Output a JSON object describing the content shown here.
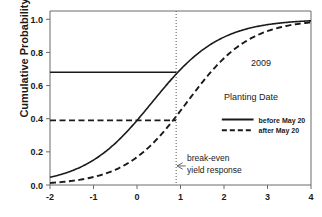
{
  "chart_data": {
    "type": "line",
    "title": "",
    "xlabel": "",
    "ylabel": "Cumulative Probability",
    "xlim": [
      -2,
      4
    ],
    "ylim": [
      0,
      1.05
    ],
    "xticks": [
      "-2",
      "-1",
      "0",
      "1",
      "2",
      "3",
      "4"
    ],
    "xtick_values": [
      -2,
      -1,
      0,
      1,
      2,
      3,
      4
    ],
    "yticks": [
      "0.0",
      "0.2",
      "0.4",
      "0.6",
      "0.8",
      "1.0"
    ],
    "ytick_values": [
      0.0,
      0.2,
      0.4,
      0.6,
      0.8,
      1.0
    ],
    "grid": false,
    "legend_position": "right",
    "series": [
      {
        "name": "before May 20",
        "style": "solid",
        "color": "#1a1a1a",
        "model": "logistic",
        "midpoint": 0.35,
        "scale": 0.78,
        "x": [
          -2.0,
          -1.75,
          -1.5,
          -1.25,
          -1.0,
          -0.75,
          -0.5,
          -0.25,
          0.0,
          0.25,
          0.5,
          0.75,
          0.9,
          1.0,
          1.25,
          1.5,
          1.75,
          2.0,
          2.25,
          2.5,
          2.75,
          3.0,
          3.25,
          3.5,
          3.75,
          4.0
        ],
        "y": [
          0.048,
          0.064,
          0.085,
          0.112,
          0.147,
          0.19,
          0.243,
          0.305,
          0.376,
          0.452,
          0.53,
          0.605,
          0.647,
          0.674,
          0.736,
          0.79,
          0.835,
          0.872,
          0.901,
          0.925,
          0.943,
          0.957,
          0.968,
          0.976,
          0.982,
          0.987
        ]
      },
      {
        "name": "after May 20",
        "style": "dashed",
        "color": "#1a1a1a",
        "model": "logistic",
        "midpoint": 1.15,
        "scale": 0.72,
        "x": [
          -2.0,
          -1.75,
          -1.5,
          -1.25,
          -1.0,
          -0.75,
          -0.5,
          -0.25,
          0.0,
          0.25,
          0.5,
          0.75,
          0.9,
          1.0,
          1.25,
          1.5,
          1.75,
          2.0,
          2.25,
          2.5,
          2.75,
          3.0,
          3.25,
          3.5,
          3.75,
          4.0
        ],
        "y": [
          0.013,
          0.018,
          0.025,
          0.035,
          0.048,
          0.066,
          0.091,
          0.124,
          0.166,
          0.219,
          0.283,
          0.356,
          0.403,
          0.435,
          0.517,
          0.598,
          0.673,
          0.74,
          0.796,
          0.843,
          0.88,
          0.909,
          0.932,
          0.949,
          0.962,
          0.972
        ]
      }
    ],
    "reference_lines": [
      {
        "name": "break-even-vertical",
        "orientation": "vertical",
        "value": 0.9,
        "style": "dotted"
      },
      {
        "name": "before-may-20-probability",
        "orientation": "horizontal",
        "value": 0.68,
        "style": "solid",
        "x_from": -2,
        "x_to": 0.9
      },
      {
        "name": "after-may-20-probability",
        "orientation": "horizontal",
        "value": 0.39,
        "style": "dashed",
        "x_from": -2,
        "x_to": 0.9
      }
    ],
    "annotations": [
      {
        "name": "year",
        "text": "2009",
        "x": 2.85,
        "y": 0.72
      },
      {
        "name": "break-even-line1",
        "text": "break-even",
        "x": 1.15,
        "y": 0.145
      },
      {
        "name": "break-even-line2",
        "text": "yield response",
        "x": 1.15,
        "y": 0.075
      }
    ],
    "legend": {
      "title": "Planting Date",
      "entries": [
        {
          "label": "before May 20",
          "style": "solid"
        },
        {
          "label": "after May 20",
          "style": "dashed"
        }
      ]
    }
  }
}
